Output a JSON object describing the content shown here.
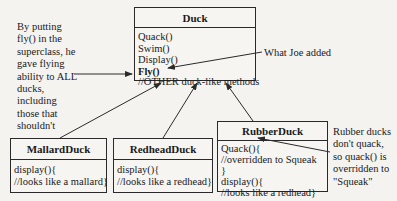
{
  "diagram": {
    "classes": {
      "duck": {
        "name": "Duck",
        "methods": [
          "Quack()",
          "Swim()",
          "Display()",
          "Fly()",
          "//OTHER duck-like methods"
        ]
      },
      "mallard": {
        "name": "MallardDuck",
        "methods": [
          "display(){",
          "//looks like a mallard}"
        ]
      },
      "redhead": {
        "name": "RedheadDuck",
        "methods": [
          "display(){",
          "//looks like a redhead}"
        ]
      },
      "rubber": {
        "name": "RubberDuck",
        "methods": [
          "Quack(){",
          "//overridden to Squeak",
          "}",
          "display(){",
          "//looks like a redhead}"
        ]
      }
    },
    "notes": {
      "left": [
        "By putting",
        "fly() in the",
        "superclass, he",
        "gave flying",
        "ability to ALL",
        "ducks,",
        "including",
        "those that",
        "shouldn't"
      ],
      "joe": "What Joe added",
      "right": [
        "Rubber ducks",
        "don't quack,",
        "so quack() is",
        "overridden to",
        "\"Squeak\""
      ]
    },
    "colors": {
      "background": "#f4f3f0",
      "line": "#2a2a2a"
    }
  }
}
